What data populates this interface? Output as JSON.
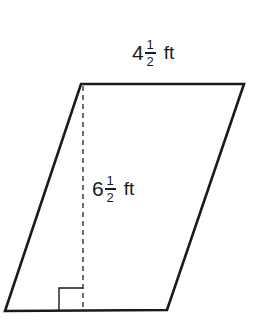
{
  "diagram": {
    "shape": "parallelogram",
    "colors": {
      "stroke": "#1a1a1a",
      "background": "#ffffff"
    },
    "vertices": {
      "top_left": [
        81,
        84
      ],
      "top_right": [
        244,
        84
      ],
      "bottom_right": [
        167,
        310
      ],
      "bottom_left": [
        5,
        311
      ]
    },
    "height_line": {
      "x": 83,
      "y1": 84,
      "y2": 311,
      "style": "dashed"
    },
    "right_angle_marker": {
      "x": 59,
      "y": 288,
      "size": 24
    },
    "labels": {
      "base": {
        "whole": "4",
        "numerator": "1",
        "denominator": "2",
        "unit": "ft"
      },
      "height": {
        "whole": "6",
        "numerator": "1",
        "denominator": "2",
        "unit": "ft"
      }
    }
  }
}
